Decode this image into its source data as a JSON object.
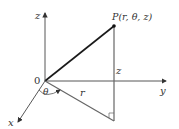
{
  "diagram": {
    "labels": {
      "z_axis": "z",
      "y_axis": "y",
      "x_axis": "x",
      "origin": "0",
      "point": "P(r, θ, z)",
      "angle": "θ",
      "radius": "r",
      "height": "z"
    },
    "colors": {
      "axis": "#333333",
      "segment_op": "#1a1a1a",
      "vertical": "#555555",
      "radius_line": "#555555",
      "point": "#111111"
    }
  }
}
